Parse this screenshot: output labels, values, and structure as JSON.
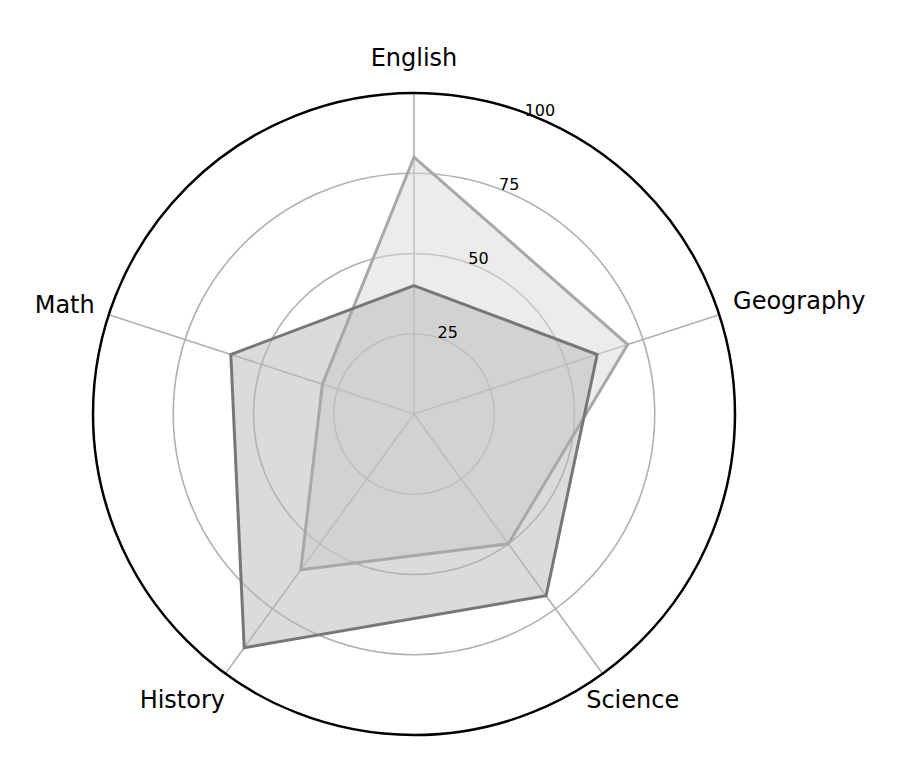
{
  "chart_data": {
    "type": "radar",
    "title": "",
    "categories": [
      "English",
      "Geography",
      "Science",
      "History",
      "Math"
    ],
    "series": [
      {
        "name": "Series A",
        "values": [
          80,
          70,
          50,
          60,
          30
        ],
        "line_color": "#a8a8a8",
        "fill_color": "#d9d9d9",
        "fill_opacity": 0.5
      },
      {
        "name": "Series B",
        "values": [
          40,
          60,
          70,
          90,
          60
        ],
        "line_color": "#777777",
        "fill_color": "#b8b8b8",
        "fill_opacity": 0.5
      }
    ],
    "rlim": [
      0,
      100
    ],
    "r_ticks": [
      25,
      50,
      75,
      100
    ],
    "r_tick_labels": [
      "25",
      "50",
      "75",
      "100"
    ],
    "grid": true,
    "legend": null
  },
  "layout": {
    "center": [
      414,
      414
    ],
    "radius": 321,
    "grid_color": "#b0b0b0",
    "outer_color": "#000000",
    "tick_label_angle_deg": 22.5
  }
}
